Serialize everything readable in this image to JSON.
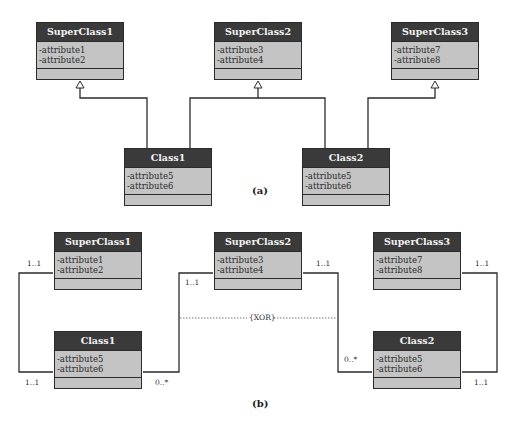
{
  "diagram_a": {
    "caption": "(a)",
    "superclasses": [
      {
        "name": "SuperClass1",
        "attributes": [
          "-attribute1",
          "-attribute2"
        ]
      },
      {
        "name": "SuperClass2",
        "attributes": [
          "-attribute3",
          "-attribute4"
        ]
      },
      {
        "name": "SuperClass3",
        "attributes": [
          "-attribute7",
          "-attribute8"
        ]
      }
    ],
    "subclasses": [
      {
        "name": "Class1",
        "attributes": [
          "-attribute5",
          "-attribute6"
        ]
      },
      {
        "name": "Class2",
        "attributes": [
          "-attribute5",
          "-attribute6"
        ]
      }
    ],
    "relations": [
      {
        "from": "Class1",
        "to": "SuperClass1",
        "type": "generalization"
      },
      {
        "from": "Class1",
        "to": "SuperClass2",
        "type": "generalization"
      },
      {
        "from": "Class2",
        "to": "SuperClass2",
        "type": "generalization"
      },
      {
        "from": "Class2",
        "to": "SuperClass3",
        "type": "generalization"
      }
    ]
  },
  "diagram_b": {
    "caption": "(b)",
    "superclasses": [
      {
        "name": "SuperClass1",
        "attributes": [
          "-attribute1",
          "-attribute2"
        ]
      },
      {
        "name": "SuperClass2",
        "attributes": [
          "-attribute3",
          "-attribute4"
        ]
      },
      {
        "name": "SuperClass3",
        "attributes": [
          "-attribute7",
          "-attribute8"
        ]
      }
    ],
    "subclasses": [
      {
        "name": "Class1",
        "attributes": [
          "-attribute5",
          "-attribute6"
        ]
      },
      {
        "name": "Class2",
        "attributes": [
          "-attribute5",
          "-attribute6"
        ]
      }
    ],
    "multiplicities": {
      "sc1_left": "1..1",
      "c1_left": "1..1",
      "sc2_class1": "1..1",
      "c1_right": "0..*",
      "sc2_class2": "1..1",
      "c2_left": "0..*",
      "sc3_right": "1..1",
      "c2_right": "1..1"
    },
    "constraint": "{XOR}"
  }
}
